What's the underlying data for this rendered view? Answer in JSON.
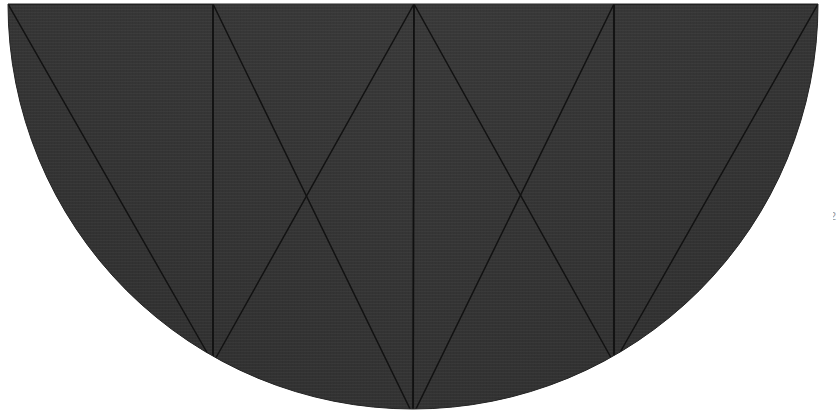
{
  "scene": {
    "title": "Semicircular segmented fan panel",
    "background_color": "#ffffff",
    "width": 840,
    "height": 420
  },
  "figure": {
    "name": "semicircular-fan",
    "shape": "half-disc",
    "fill_color": "#353535",
    "fill_color_dark": "#2e2e2e",
    "top_bevel_color": "#8c8c8c",
    "seam_color": "#141414",
    "rib_color": "#121212",
    "center_x": 413,
    "center_y": 4,
    "radius": 405,
    "left_edge_x": 8,
    "right_edge_x": 818,
    "top_edge_y": 4,
    "bottom_y": 409,
    "panel_count": 4,
    "vertical_seams_x": [
      213,
      414,
      614
    ],
    "panel_foot_points": [
      {
        "x": 213,
        "y": 363
      },
      {
        "x": 413,
        "y": 415
      },
      {
        "x": 614,
        "y": 363
      }
    ],
    "rib_crossings": [
      {
        "x": 307,
        "y": 196
      },
      {
        "x": 520,
        "y": 196
      }
    ]
  },
  "annotations": {
    "edge_digit": "2"
  }
}
